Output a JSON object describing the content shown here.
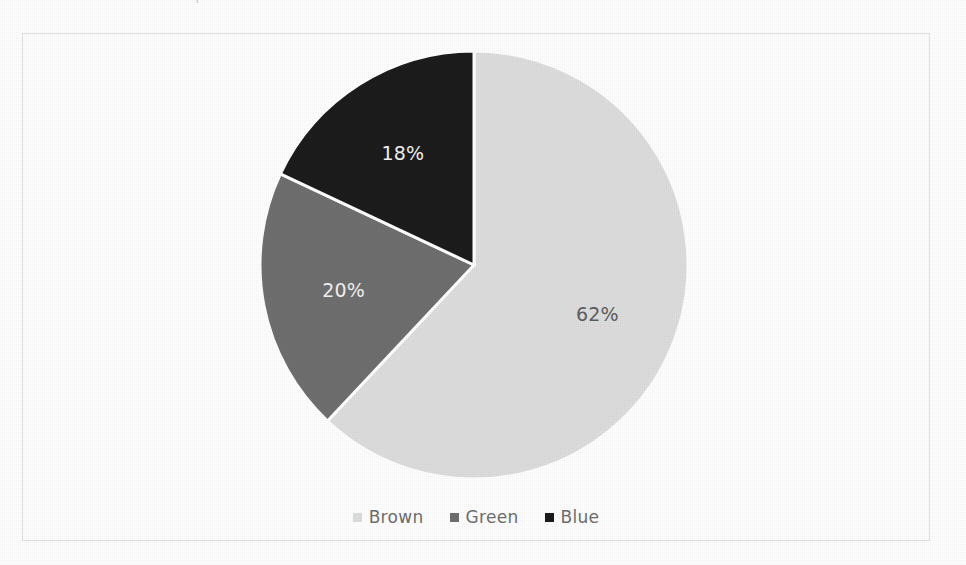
{
  "page": {
    "background_color": "#ffffff",
    "scan_artifact_top": [
      "’",
      "†"
    ]
  },
  "frame": {
    "border_color": "#e3e3e3",
    "background_color": "#ffffff"
  },
  "chart_data": {
    "type": "pie",
    "title": "",
    "subtitle": "",
    "xlabel": "",
    "ylabel": "",
    "categories": [
      "Brown",
      "Green",
      "Blue"
    ],
    "values": [
      62,
      20,
      18
    ],
    "labels": [
      "62%",
      "20%",
      "18%"
    ],
    "units": "percent",
    "total": 100,
    "start_angle_deg": 0,
    "direction": "clockwise",
    "slice_separator_color": "#ffffff",
    "slice_separator_width_px": 3,
    "colors": [
      "#dedede",
      "#6f6f6f",
      "#1c1c1c"
    ],
    "label_colors": [
      "#5e5e5e",
      "#f2f2f2",
      "#f2f2f2"
    ],
    "grid": false,
    "legend": {
      "position": "bottom",
      "entries": [
        {
          "label": "Brown",
          "color": "#dedede",
          "value": 62
        },
        {
          "label": "Green",
          "color": "#6f6f6f",
          "value": 20
        },
        {
          "label": "Blue",
          "color": "#1c1c1c",
          "value": 18
        }
      ]
    },
    "slices": [
      {
        "name": "Brown",
        "value": 62,
        "label": "62%",
        "color": "#dedede",
        "label_color": "#5e5e5e",
        "start_angle_deg": 0,
        "end_angle_deg": 223.2
      },
      {
        "name": "Green",
        "value": 20,
        "label": "20%",
        "color": "#6f6f6f",
        "label_color": "#f2f2f2",
        "start_angle_deg": 223.2,
        "end_angle_deg": 295.2
      },
      {
        "name": "Blue",
        "value": 18,
        "label": "18%",
        "color": "#1c1c1c",
        "label_color": "#f2f2f2",
        "start_angle_deg": 295.2,
        "end_angle_deg": 360
      }
    ]
  }
}
